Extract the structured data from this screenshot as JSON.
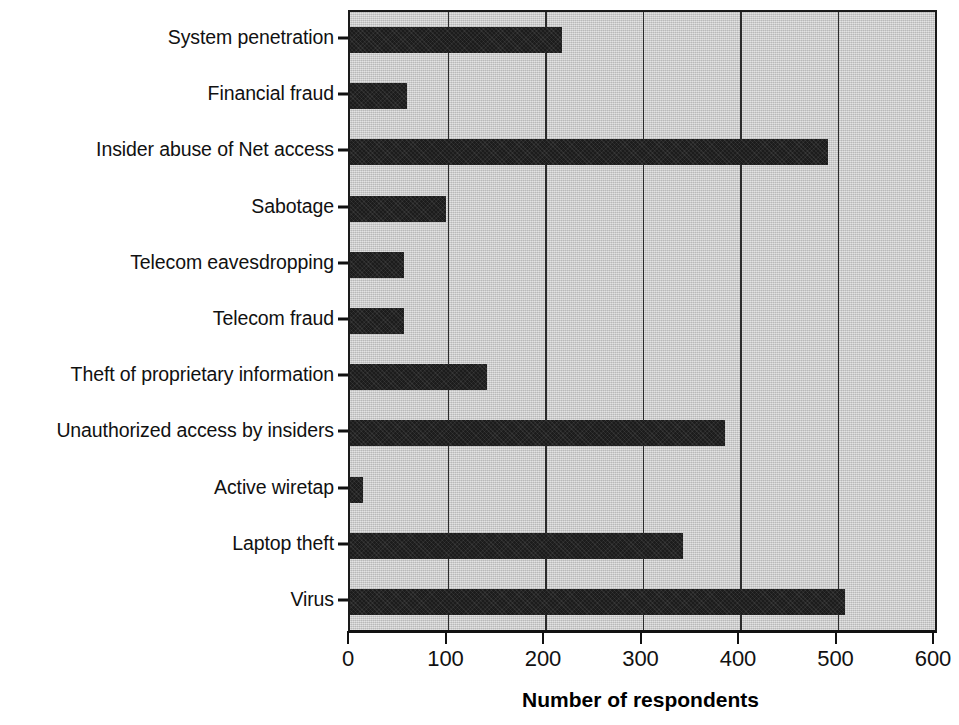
{
  "chart_data": {
    "type": "bar",
    "orientation": "horizontal",
    "title": "",
    "subtitle": "",
    "xlabel": "Number of respondents",
    "ylabel": "",
    "xlim": [
      0,
      600
    ],
    "xticks": [
      0,
      100,
      200,
      300,
      400,
      500,
      600
    ],
    "xtick_labels": [
      "0",
      "100",
      "200",
      "300",
      "400",
      "500",
      "600"
    ],
    "grid": "vertical",
    "legend": "none",
    "categories": [
      "System penetration",
      "Financial fraud",
      "Insider abuse of Net access",
      "Sabotage",
      "Telecom eavesdropping",
      "Telecom fraud",
      "Theft of proprietary information",
      "Unauthorized access by insiders",
      "Active wiretap",
      "Laptop theft",
      "Virus"
    ],
    "values": [
      217,
      58,
      490,
      98,
      55,
      55,
      140,
      385,
      13,
      342,
      508
    ],
    "series": [
      {
        "name": "Number of respondents",
        "values": [
          217,
          58,
          490,
          98,
          55,
          55,
          140,
          385,
          13,
          342,
          508
        ]
      }
    ],
    "colors": {
      "bar": "#1c1c1c",
      "plot_background": "#c9c9c9",
      "axis": "#111111",
      "gridline": "#2b2b2b",
      "page_background": "#ffffff"
    }
  }
}
